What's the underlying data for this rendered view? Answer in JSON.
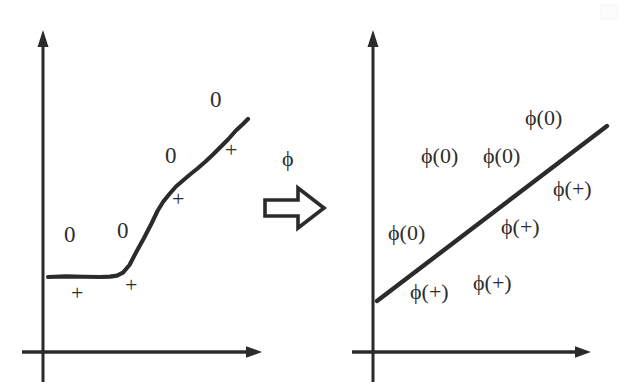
{
  "figure": {
    "background_color": "#ffffff",
    "ink_color": "#2b2b2b"
  },
  "transform": {
    "label": "ϕ",
    "arrow_icon": "hollow-right-arrow-icon",
    "direction": "left-to-right"
  },
  "left_panel": {
    "name": "input-space",
    "axes": {
      "y_axis": {
        "x": 43,
        "y_top": 32,
        "y_bottom": 382
      },
      "x_axis": {
        "y": 352,
        "x_left": 22,
        "x_right": 262
      },
      "arrowheads": [
        "up",
        "right"
      ]
    },
    "boundary": {
      "type": "sigmoid-curve",
      "points": [
        [
          48,
          277
        ],
        [
          78,
          276
        ],
        [
          100,
          277
        ],
        [
          116,
          276
        ],
        [
          124,
          273
        ],
        [
          132,
          262
        ],
        [
          142,
          243
        ],
        [
          152,
          222
        ],
        [
          160,
          205
        ],
        [
          168,
          193
        ],
        [
          176,
          183
        ],
        [
          186,
          175
        ],
        [
          196,
          168
        ],
        [
          206,
          160
        ],
        [
          216,
          151
        ],
        [
          226,
          142
        ],
        [
          236,
          131
        ],
        [
          248,
          119
        ]
      ]
    },
    "labels": [
      {
        "text": "0",
        "x": 64,
        "y": 223,
        "kind": "zero"
      },
      {
        "text": "0",
        "x": 117,
        "y": 219,
        "kind": "zero"
      },
      {
        "text": "0",
        "x": 165,
        "y": 144,
        "kind": "zero"
      },
      {
        "text": "0",
        "x": 210,
        "y": 88,
        "kind": "zero"
      },
      {
        "text": "+",
        "x": 71,
        "y": 282,
        "kind": "plus"
      },
      {
        "text": "+",
        "x": 125,
        "y": 274,
        "kind": "plus"
      },
      {
        "text": "+",
        "x": 172,
        "y": 188,
        "kind": "plus"
      },
      {
        "text": "+",
        "x": 225,
        "y": 139,
        "kind": "plus"
      }
    ]
  },
  "right_panel": {
    "name": "feature-space",
    "axes": {
      "y_axis": {
        "x": 373,
        "y_top": 32,
        "y_bottom": 382
      },
      "x_axis": {
        "y": 352,
        "x_left": 352,
        "x_right": 591
      },
      "arrowheads": [
        "up",
        "right"
      ]
    },
    "boundary": {
      "type": "straight-line",
      "start": [
        377,
        301
      ],
      "end": [
        607,
        126
      ]
    },
    "labels": [
      {
        "text": "ϕ(0)",
        "x": 525,
        "y": 107,
        "kind": "map"
      },
      {
        "text": "ϕ(0)",
        "x": 421,
        "y": 145,
        "kind": "map"
      },
      {
        "text": "ϕ(0)",
        "x": 483,
        "y": 145,
        "kind": "map"
      },
      {
        "text": "ϕ(+)",
        "x": 553,
        "y": 178,
        "kind": "map"
      },
      {
        "text": "ϕ(0)",
        "x": 388,
        "y": 222,
        "kind": "map"
      },
      {
        "text": "ϕ(+)",
        "x": 501,
        "y": 216,
        "kind": "map"
      },
      {
        "text": "ϕ(+)",
        "x": 410,
        "y": 281,
        "kind": "map"
      },
      {
        "text": "ϕ(+)",
        "x": 473,
        "y": 272,
        "kind": "map"
      }
    ]
  }
}
